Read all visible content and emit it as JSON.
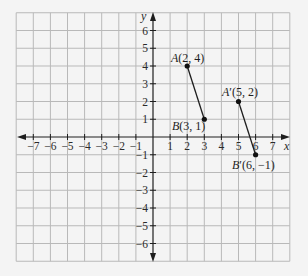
{
  "figure": {
    "type": "coordinate-plane",
    "x_axis": {
      "label": "x",
      "min": -8,
      "max": 8,
      "tick_labels": [
        "−7",
        "−6",
        "−5",
        "−4",
        "−3",
        "−2",
        "−1",
        "1",
        "2",
        "3",
        "4",
        "5",
        "6",
        "7"
      ],
      "tick_values": [
        -7,
        -6,
        -5,
        -4,
        -3,
        -2,
        -1,
        1,
        2,
        3,
        4,
        5,
        6,
        7
      ]
    },
    "y_axis": {
      "label": "y",
      "min": -7,
      "max": 7,
      "tick_labels": [
        "6",
        "5",
        "4",
        "3",
        "2",
        "1",
        "−1",
        "−2",
        "−3",
        "−4",
        "−5",
        "−6"
      ],
      "tick_values": [
        6,
        5,
        4,
        3,
        2,
        1,
        -1,
        -2,
        -3,
        -4,
        -5,
        -6
      ]
    },
    "points": [
      {
        "name": "A",
        "prime": "",
        "coords": "(2, 4)",
        "x": 2,
        "y": 4
      },
      {
        "name": "B",
        "prime": "",
        "coords": "(3, 1)",
        "x": 3,
        "y": 1
      },
      {
        "name": "A",
        "prime": "′",
        "coords": "(5, 2)",
        "x": 5,
        "y": 2
      },
      {
        "name": "B",
        "prime": "′",
        "coords": "(6, −1)",
        "x": 6,
        "y": -1
      }
    ],
    "segments": [
      {
        "from": "A",
        "to": "B"
      },
      {
        "from": "A′",
        "to": "B′"
      }
    ],
    "colors": {
      "background": "#f4f4f4",
      "grid": "#b9b9b9",
      "ink": "#1e1e1e"
    }
  }
}
